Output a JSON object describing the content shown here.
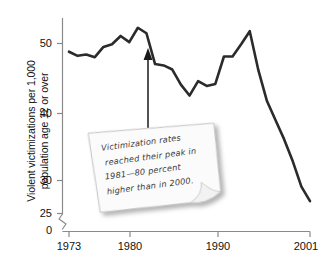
{
  "chart_data": {
    "type": "line",
    "title": "",
    "xlabel": "",
    "ylabel": "Violent victimizations per 1,000 population age 12 or over",
    "ylabel_line1": "Violent victimizations per 1,000",
    "ylabel_line2": "population age 12 or over",
    "xlim": [
      1973,
      2001
    ],
    "ylim": [
      25,
      53
    ],
    "axis_break": true,
    "axis_break_note": "y-axis broken between 0 and 25",
    "grid": false,
    "legend": null,
    "yticks": [
      {
        "value": 50,
        "label": "50"
      },
      {
        "value": 40,
        "label": "40"
      },
      {
        "value": 30,
        "label": "30"
      },
      {
        "value": 25,
        "label": "25"
      },
      {
        "value": 0,
        "label": "0"
      }
    ],
    "xticks": [
      {
        "value": 1973,
        "label": "1973"
      },
      {
        "value": 1980,
        "label": "1980"
      },
      {
        "value": 1990,
        "label": "1990"
      },
      {
        "value": 2001,
        "label": "2001"
      }
    ],
    "x": [
      1973,
      1974,
      1975,
      1976,
      1977,
      1978,
      1979,
      1980,
      1981,
      1982,
      1983,
      1984,
      1985,
      1986,
      1987,
      1988,
      1989,
      1990,
      1991,
      1992,
      1993,
      1994,
      1995,
      1996,
      1997,
      1998,
      1999,
      2000,
      2001
    ],
    "values": [
      48.8,
      48.2,
      48.4,
      48.0,
      49.5,
      49.9,
      51.1,
      50.2,
      52.3,
      51.5,
      47.0,
      46.8,
      46.2,
      44.0,
      42.4,
      44.5,
      43.8,
      44.1,
      48.1,
      48.1,
      49.9,
      51.8,
      46.1,
      41.6,
      38.8,
      36.0,
      32.8,
      29.1,
      27.0
    ],
    "series_color": "#2b2b2b",
    "line_width": 2.6,
    "annotation": {
      "text": "Victimization rates reached their peak in 1981—80 percent higher than in 2000.",
      "lines": [
        "Victimization rates",
        "reached their peak in",
        "1981—80 percent",
        "higher than in 2000."
      ],
      "arrow_points_to_year": 1981,
      "arrow_points_to_value": 52.3,
      "style": "sticky-note"
    }
  },
  "colors": {
    "background": "#ffffff",
    "line": "#2b2b2b",
    "axis": "#808080",
    "text": "#111111",
    "note_fill": "#fbfbfb",
    "note_border": "#c9c9c9",
    "note_text": "#3a3a3a",
    "shadow": "#b8b8b8"
  }
}
